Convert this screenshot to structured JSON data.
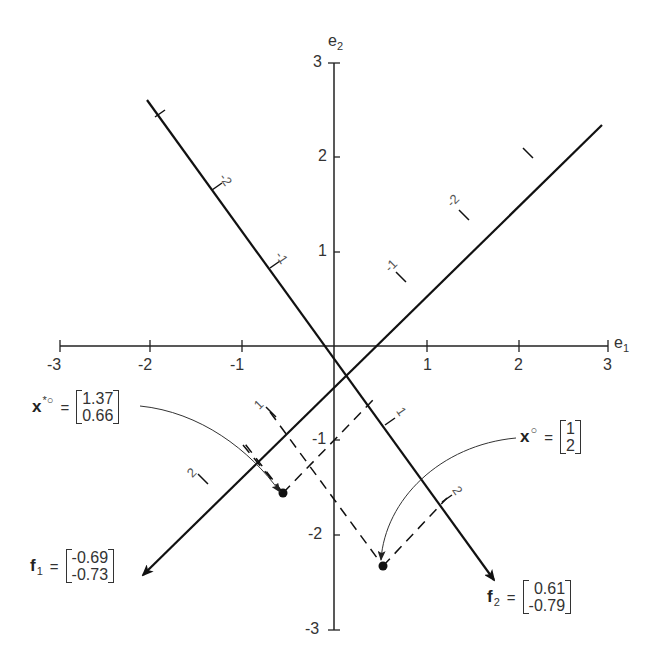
{
  "figure": {
    "axes": {
      "e1_label": "e",
      "e1_sub": "1",
      "e2_label": "e",
      "e2_sub": "2",
      "e1_ticks": [
        "-3",
        "-2",
        "-1",
        "1",
        "2",
        "3"
      ],
      "e2_ticks_pos": [
        "1",
        "2",
        "3"
      ],
      "e2_ticks_neg": [
        "-1",
        "-2",
        "-3"
      ]
    },
    "oblique_axes": {
      "f1_upper_ticks": [
        "-1",
        "-2"
      ],
      "f2_upper_ticks": [
        "-1",
        "-2"
      ],
      "f1_lower_ticks": [
        "1",
        "2"
      ],
      "f2_lower_ticks": [
        "1",
        "2"
      ]
    },
    "vectors": {
      "x_star": {
        "name": "x",
        "superscript": "*○",
        "equals": "=",
        "values": [
          "1.37",
          "0.66"
        ]
      },
      "x": {
        "name": "x",
        "superscript": "○",
        "equals": "=",
        "values": [
          "1",
          "2"
        ]
      },
      "f1": {
        "name": "f",
        "subscript": "1",
        "equals": "=",
        "values": [
          "-0.69",
          "-0.73"
        ]
      },
      "f2": {
        "name": "f",
        "subscript": "2",
        "equals": "=",
        "values": [
          "0.61",
          "-0.79"
        ]
      }
    },
    "colors": {
      "line": "#111111",
      "text": "#333333",
      "background": "#ffffff"
    }
  }
}
